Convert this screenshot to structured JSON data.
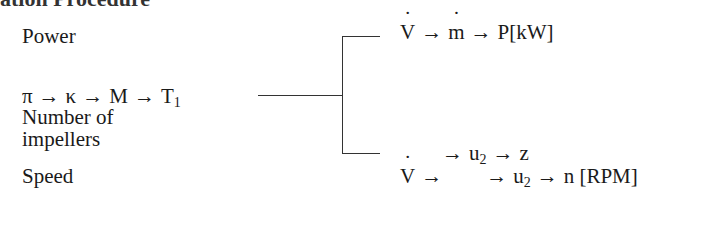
{
  "heading_fragment": "ation Procedure",
  "left": {
    "power_label": "Power",
    "chain": [
      "π",
      "κ",
      "M",
      "T"
    ],
    "chain_last_subscript": "1",
    "impellers_label_line1": "Number of",
    "impellers_label_line2": "impellers",
    "speed_label": "Speed"
  },
  "right": {
    "power_chain": {
      "v": "V",
      "m": "m",
      "result": "P[kW]"
    },
    "impeller_chain": {
      "u": "u",
      "u_sub": "2",
      "result": "z"
    },
    "speed_chain": {
      "v": "V",
      "u": "u",
      "u_sub": "2",
      "result": "n [RPM]"
    }
  },
  "arrow": "→"
}
